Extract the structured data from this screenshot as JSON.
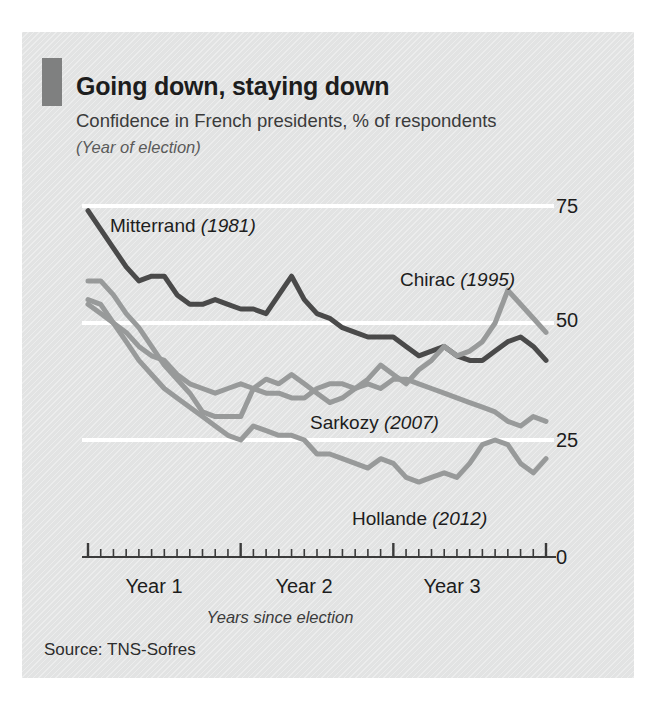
{
  "panel": {
    "title": "Going down, staying down",
    "subtitle": "Confidence in French presidents, % of respondents",
    "subtitle2": "(Year of election)",
    "source": "Source: TNS-Sofres"
  },
  "colors": {
    "background": "#e2e3e3",
    "accent_bar": "#7f8080",
    "dark_series": "#4a4a4a",
    "grey_series": "#989a9a",
    "gridline": "#ffffff",
    "axis": "#3b3b3b",
    "text": "#1d1d1d"
  },
  "labels": {
    "mitterrand": {
      "name": "Mitterrand",
      "year": "(1981)"
    },
    "chirac": {
      "name": "Chirac",
      "year": "(1995)"
    },
    "sarkozy": {
      "name": "Sarkozy",
      "year": "(2007)"
    },
    "hollande": {
      "name": "Hollande",
      "year": "(2012)"
    }
  },
  "chart_data": {
    "type": "line",
    "title": "Going down, staying down",
    "subtitle": "Confidence in French presidents, % of respondents",
    "xlabel": "Years since election",
    "ylabel": "% of respondents",
    "ylim": [
      0,
      75
    ],
    "xlim": [
      0,
      36
    ],
    "yticks": [
      0,
      25,
      50,
      75
    ],
    "ytick_labels": [
      "0",
      "25",
      "50",
      "75"
    ],
    "xticks_major": [
      0,
      12,
      24,
      36
    ],
    "xtick_labels": [
      "Year 1",
      "Year 2",
      "Year 3"
    ],
    "xtick_label_positions": [
      6,
      18,
      30
    ],
    "x_minor_tick_interval": 1,
    "x_unit": "months since election",
    "grid": "horizontal-white",
    "legend": "inline-annotations",
    "series": [
      {
        "name": "Mitterrand",
        "election_year": 1981,
        "color": "#4a4a4a",
        "x": [
          0,
          1,
          2,
          3,
          4,
          5,
          6,
          7,
          8,
          9,
          10,
          11,
          12,
          13,
          14,
          15,
          16,
          17,
          18,
          19,
          20,
          21,
          22,
          23,
          24,
          25,
          26,
          27,
          28,
          29,
          30,
          31,
          32,
          33,
          34,
          35,
          36
        ],
        "values": [
          74,
          70,
          66,
          62,
          59,
          60,
          60,
          56,
          54,
          54,
          55,
          54,
          53,
          53,
          52,
          56,
          60,
          55,
          52,
          51,
          49,
          48,
          47,
          47,
          47,
          45,
          43,
          44,
          45,
          43,
          42,
          42,
          44,
          46,
          47,
          45,
          42
        ]
      },
      {
        "name": "Chirac",
        "election_year": 1995,
        "color": "#989a9a",
        "x": [
          0,
          1,
          2,
          3,
          4,
          5,
          6,
          7,
          8,
          9,
          10,
          11,
          12,
          13,
          14,
          15,
          16,
          17,
          18,
          19,
          20,
          21,
          22,
          23,
          24,
          25,
          26,
          27,
          28,
          29,
          30,
          31,
          32,
          33,
          34,
          35,
          36
        ],
        "values": [
          59,
          59,
          56,
          52,
          49,
          45,
          41,
          38,
          35,
          31,
          30,
          30,
          30,
          36,
          38,
          37,
          39,
          37,
          35,
          33,
          34,
          36,
          38,
          41,
          39,
          37,
          40,
          42,
          45,
          43,
          44,
          46,
          50,
          57,
          54,
          51,
          48
        ]
      },
      {
        "name": "Sarkozy",
        "election_year": 2007,
        "color": "#989a9a",
        "x": [
          0,
          1,
          2,
          3,
          4,
          5,
          6,
          7,
          8,
          9,
          10,
          11,
          12,
          13,
          14,
          15,
          16,
          17,
          18,
          19,
          20,
          21,
          22,
          23,
          24,
          25,
          26,
          27,
          28,
          29,
          30,
          31,
          32,
          33,
          34,
          35,
          36
        ],
        "values": [
          54,
          52,
          50,
          48,
          45,
          43,
          42,
          39,
          37,
          36,
          35,
          36,
          37,
          36,
          35,
          35,
          34,
          34,
          36,
          37,
          37,
          36,
          37,
          36,
          38,
          38,
          37,
          36,
          35,
          34,
          33,
          32,
          31,
          29,
          28,
          30,
          29
        ]
      },
      {
        "name": "Hollande",
        "election_year": 2012,
        "color": "#989a9a",
        "x": [
          0,
          1,
          2,
          3,
          4,
          5,
          6,
          7,
          8,
          9,
          10,
          11,
          12,
          13,
          14,
          15,
          16,
          17,
          18,
          19,
          20,
          21,
          22,
          23,
          24,
          25,
          26,
          27,
          28,
          29,
          30,
          31,
          32,
          33,
          34,
          35,
          36
        ],
        "values": [
          55,
          54,
          50,
          46,
          42,
          39,
          36,
          34,
          32,
          30,
          28,
          26,
          25,
          28,
          27,
          26,
          26,
          25,
          22,
          22,
          21,
          20,
          19,
          21,
          20,
          17,
          16,
          17,
          18,
          17,
          20,
          24,
          25,
          24,
          20,
          18,
          21
        ]
      }
    ]
  }
}
